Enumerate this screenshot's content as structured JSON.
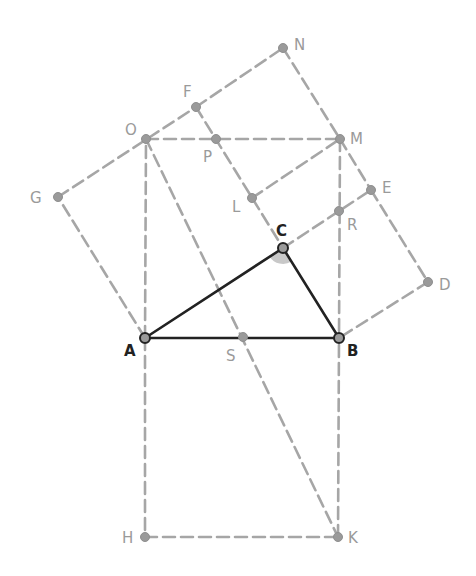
{
  "diagram": {
    "type": "geometry",
    "colors": {
      "main_lines": "#222222",
      "construction_lines": "#a6a6a6",
      "points": "#9a9a9a",
      "angle_marker": "#c8c8c8"
    },
    "points": [
      {
        "id": "A",
        "label": "A",
        "x": 145,
        "y": 338,
        "main": true,
        "lx": 124,
        "ly": 356
      },
      {
        "id": "B",
        "label": "B",
        "x": 339,
        "y": 338,
        "main": true,
        "lx": 347,
        "ly": 356
      },
      {
        "id": "C",
        "label": "C",
        "x": 283,
        "y": 248,
        "main": true,
        "lx": 276,
        "ly": 236
      },
      {
        "id": "D",
        "label": "D",
        "x": 428,
        "y": 282,
        "main": false,
        "lx": 439,
        "ly": 290
      },
      {
        "id": "E",
        "label": "E",
        "x": 371,
        "y": 190,
        "main": false,
        "lx": 382,
        "ly": 193
      },
      {
        "id": "F",
        "label": "F",
        "x": 196,
        "y": 107,
        "main": false,
        "lx": 183,
        "ly": 97
      },
      {
        "id": "G",
        "label": "G",
        "x": 58,
        "y": 197,
        "main": false,
        "lx": 30,
        "ly": 203
      },
      {
        "id": "H",
        "label": "H",
        "x": 145,
        "y": 537,
        "main": false,
        "lx": 122,
        "ly": 543
      },
      {
        "id": "K",
        "label": "K",
        "x": 338,
        "y": 537,
        "main": false,
        "lx": 348,
        "ly": 543
      },
      {
        "id": "L",
        "label": "L",
        "x": 252,
        "y": 198,
        "main": false,
        "lx": 232,
        "ly": 212
      },
      {
        "id": "M",
        "label": "M",
        "x": 340,
        "y": 139,
        "main": false,
        "lx": 350,
        "ly": 144
      },
      {
        "id": "N",
        "label": "N",
        "x": 283,
        "y": 48,
        "main": false,
        "lx": 294,
        "ly": 50
      },
      {
        "id": "O",
        "label": "O",
        "x": 146,
        "y": 139,
        "main": false,
        "lx": 125,
        "ly": 135
      },
      {
        "id": "P",
        "label": "P",
        "x": 216,
        "y": 139,
        "main": false,
        "lx": 203,
        "ly": 162
      },
      {
        "id": "R",
        "label": "R",
        "x": 339,
        "y": 211,
        "main": false,
        "lx": 347,
        "ly": 230
      },
      {
        "id": "S",
        "label": "S",
        "x": 243,
        "y": 337,
        "main": false,
        "lx": 226,
        "ly": 361
      }
    ],
    "solid_segments": [
      [
        "A",
        "B"
      ],
      [
        "B",
        "C"
      ],
      [
        "C",
        "A"
      ]
    ],
    "dashed_segments": [
      [
        "A",
        "H"
      ],
      [
        "H",
        "K"
      ],
      [
        "K",
        "B"
      ],
      [
        "A",
        "O"
      ],
      [
        "O",
        "M"
      ],
      [
        "M",
        "B"
      ],
      [
        "A",
        "G"
      ],
      [
        "G",
        "F"
      ],
      [
        "F",
        "C"
      ],
      [
        "C",
        "E"
      ],
      [
        "E",
        "D"
      ],
      [
        "D",
        "B"
      ],
      [
        "F",
        "N"
      ],
      [
        "N",
        "M"
      ],
      [
        "M",
        "E"
      ],
      [
        "L",
        "M"
      ],
      [
        "O",
        "K"
      ]
    ],
    "angle_marker": {
      "vertex": "C",
      "label": "right angle at C"
    }
  }
}
